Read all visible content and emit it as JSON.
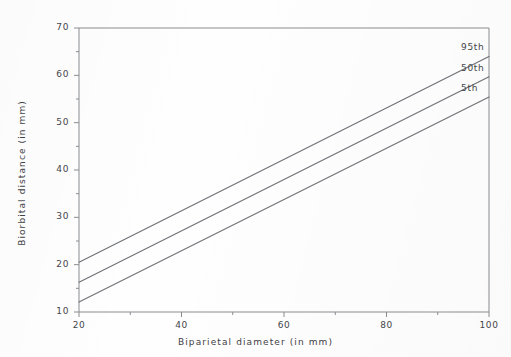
{
  "chart_data": {
    "type": "line",
    "title": "",
    "subtitle": "",
    "xlabel": "Biparietal diameter (in mm)",
    "ylabel": "Biorbital distance (in mm)",
    "xlim": [
      20,
      100
    ],
    "ylim": [
      10,
      70
    ],
    "xticks": [
      20,
      40,
      60,
      80,
      100
    ],
    "yticks": [
      10,
      20,
      30,
      40,
      50,
      60,
      70
    ],
    "xtick_labels": [
      "20",
      "40",
      "60",
      "80",
      "100"
    ],
    "ytick_labels": [
      "10",
      "20",
      "30",
      "40",
      "50",
      "60",
      "70"
    ],
    "x_minor_interval": 10,
    "y_minor_interval": 5,
    "grid": false,
    "legend_position": "right-inline-labels",
    "x": [
      20,
      100
    ],
    "series": [
      {
        "name": "95th",
        "label": "95th",
        "values": [
          20.5,
          64.0
        ],
        "color": "#6f7176"
      },
      {
        "name": "50th",
        "label": "50th",
        "values": [
          16.3,
          59.7
        ],
        "color": "#6f7176"
      },
      {
        "name": "5th",
        "label": "5th",
        "values": [
          12.1,
          55.4
        ],
        "color": "#6f7176"
      }
    ],
    "annotations": [
      {
        "text": "95th",
        "x": 100,
        "y": 64.0
      },
      {
        "text": "50th",
        "x": 100,
        "y": 59.7
      },
      {
        "text": "5th",
        "x": 100,
        "y": 55.4
      }
    ],
    "axis_color": "#8a8c90",
    "line_color": "#6f7176",
    "background_color": "#fefefe"
  }
}
